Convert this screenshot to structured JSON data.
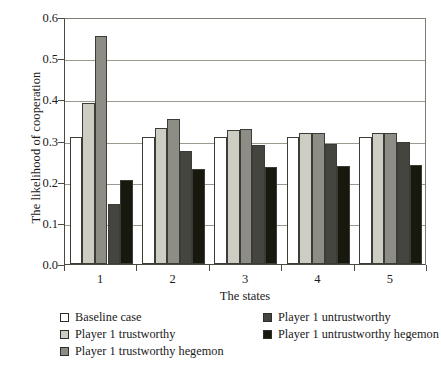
{
  "chart_data": {
    "type": "bar",
    "title": "",
    "xlabel": "The states",
    "ylabel": "The likelihood of cooperation",
    "categories": [
      "1",
      "2",
      "3",
      "4",
      "5"
    ],
    "ylim": [
      0.0,
      0.6
    ],
    "yticks": [
      "0.0",
      "0.1",
      "0.2",
      "0.3",
      "0.4",
      "0.5",
      "0.6"
    ],
    "ytick_values": [
      0.0,
      0.1,
      0.2,
      0.3,
      0.4,
      0.5,
      0.6
    ],
    "grid": true,
    "legend_position": "below-plot",
    "series": [
      {
        "name": "Baseline case",
        "color": "#ffffff",
        "values": [
          0.308,
          0.308,
          0.309,
          0.309,
          0.309
        ]
      },
      {
        "name": "Player 1 trustworthy",
        "color": "#cdcdc4",
        "values": [
          0.392,
          0.331,
          0.325,
          0.318,
          0.318
        ]
      },
      {
        "name": "Player 1 trustworthy hegemon",
        "color": "#8d8d85",
        "values": [
          0.553,
          0.353,
          0.329,
          0.318,
          0.319
        ]
      },
      {
        "name": "Player 1 untrustworthy",
        "color": "#454540",
        "values": [
          0.147,
          0.275,
          0.288,
          0.291,
          0.296
        ]
      },
      {
        "name": "Player 1 untrustworthy hegemon",
        "color": "#18180f",
        "values": [
          0.203,
          0.231,
          0.236,
          0.237,
          0.24
        ]
      }
    ]
  }
}
